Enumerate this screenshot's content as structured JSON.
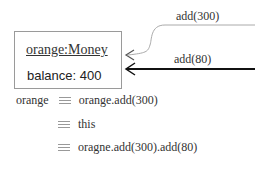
{
  "object": {
    "title": "orange:Money",
    "attribute": "balance: 400"
  },
  "messages": [
    {
      "label": "add(300)"
    },
    {
      "label": "add(80)"
    }
  ],
  "equivalences": {
    "lhs": "orange",
    "rows": [
      {
        "text": "orange.add(300)"
      },
      {
        "text": "this"
      },
      {
        "text": "oragne.add(300).add(80)"
      }
    ],
    "symbol": "identical-to"
  },
  "colors": {
    "box_border": "#9a9a9a",
    "thin_arrow": "#aaaaaa",
    "thick_arrow": "#111111"
  }
}
